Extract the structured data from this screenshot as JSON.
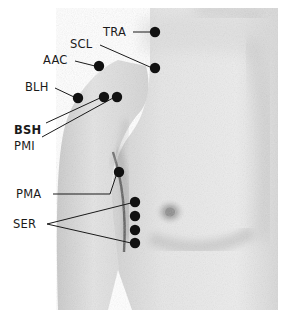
{
  "figure": {
    "caption": "Anterior right chest and shoulder photograph with labelled surface landmarks",
    "photo_bounds": {
      "x": 50,
      "y": 8,
      "width": 228,
      "height": 302
    },
    "background_color": "#ffffff",
    "skin_color": "#e9e9e9",
    "marker_color": "#111111",
    "leader_color": "#1a1a1a"
  },
  "labels": [
    {
      "id": "TRA",
      "text": "TRA",
      "bold": false,
      "x": 103,
      "y": 36,
      "anchor": "start",
      "leader": [
        [
          133,
          32
        ],
        [
          150,
          32
        ]
      ],
      "dots": [
        [
          155,
          32
        ]
      ]
    },
    {
      "id": "SCL",
      "text": "SCL",
      "bold": false,
      "x": 70,
      "y": 48,
      "anchor": "start",
      "leader": [
        [
          100,
          45
        ],
        [
          150,
          67
        ]
      ],
      "dots": [
        [
          155,
          68
        ]
      ]
    },
    {
      "id": "AAC",
      "text": "AAC",
      "bold": false,
      "x": 43,
      "y": 64,
      "anchor": "start",
      "leader": [
        [
          75,
          61
        ],
        [
          95,
          66
        ]
      ],
      "dots": [
        [
          99,
          66
        ]
      ]
    },
    {
      "id": "BLH",
      "text": "BLH",
      "bold": false,
      "x": 25,
      "y": 91,
      "anchor": "start",
      "leader": [
        [
          55,
          88
        ],
        [
          74,
          97
        ]
      ],
      "dots": [
        [
          78,
          98
        ]
      ]
    },
    {
      "id": "BSH",
      "text": "BSH",
      "bold": true,
      "x": 14,
      "y": 134,
      "anchor": "start",
      "leader": [
        [
          46,
          123
        ],
        [
          100,
          98
        ]
      ],
      "dots": [
        [
          104,
          97
        ]
      ]
    },
    {
      "id": "PMI",
      "text": "PMI",
      "bold": false,
      "x": 14,
      "y": 150,
      "anchor": "start",
      "leader": [
        [
          42,
          137
        ],
        [
          113,
          98
        ]
      ],
      "dots": [
        [
          117,
          97
        ]
      ]
    },
    {
      "id": "PMA",
      "text": "PMA",
      "bold": false,
      "x": 16,
      "y": 198,
      "anchor": "start",
      "leader": [
        [
          53,
          194
        ],
        [
          110,
          194
        ],
        [
          116,
          176
        ]
      ],
      "dots": [
        [
          119,
          172
        ]
      ]
    },
    {
      "id": "SER",
      "text": "SER",
      "bold": false,
      "x": 13,
      "y": 228,
      "anchor": "start",
      "leader": [
        [
          47,
          224
        ],
        [
          131,
          203
        ]
      ],
      "leader2": [
        [
          47,
          224
        ],
        [
          131,
          243
        ]
      ],
      "dots": [
        [
          135,
          202
        ],
        [
          135,
          216
        ],
        [
          135,
          230
        ],
        [
          135,
          243
        ]
      ]
    }
  ],
  "abbreviations": [
    "TRA",
    "SCL",
    "AAC",
    "BLH",
    "BSH",
    "PMI",
    "PMA",
    "SER"
  ]
}
